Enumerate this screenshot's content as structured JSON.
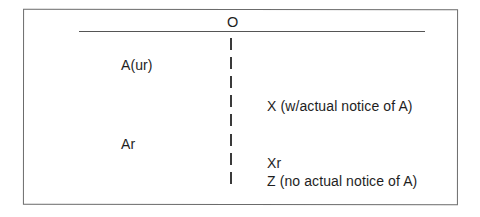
{
  "diagram": {
    "type": "title-chain-diagram",
    "root": {
      "label": "O"
    },
    "left_column": [
      {
        "label": "A(ur)"
      },
      {
        "label": "Ar"
      }
    ],
    "right_column": [
      {
        "label": "X (w/actual notice of A)"
      },
      {
        "label": "Xr"
      },
      {
        "label": "Z (no actual notice of A)"
      }
    ],
    "divider": {
      "glyph": "|",
      "segment_count": 8
    },
    "colors": {
      "text": "#1e1e1e",
      "frame": "#6b6b6b",
      "lines": "#555555"
    }
  }
}
